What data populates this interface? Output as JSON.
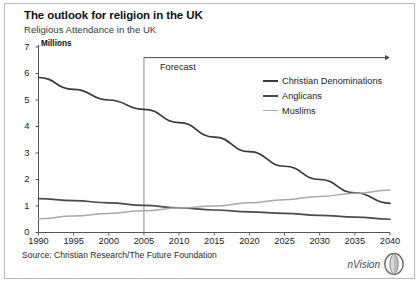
{
  "header": {
    "title": "The outlook for religion in the UK",
    "subtitle": "Religious Attendance in the UK",
    "units": "Millions"
  },
  "footer": {
    "source": "Source: Christian Research/The Future Foundation",
    "logo_text": "nVision",
    "logo_icon": "lens-circle-icon"
  },
  "annotations": {
    "forecast_label": "Forecast",
    "forecast_start_year": 2005
  },
  "colors": {
    "christian": "#3a3a3a",
    "anglicans": "#4a4a4a",
    "muslims": "#a8a8a8",
    "axis": "#555555",
    "border": "#b9b9b9",
    "background": "#ffffff"
  },
  "chart_data": {
    "type": "line",
    "title": "The outlook for religion in the UK",
    "subtitle": "Religious Attendance in the UK",
    "xlabel": "",
    "ylabel": "Millions",
    "xlim": [
      1990,
      2040
    ],
    "ylim": [
      0,
      7
    ],
    "yticks": [
      0,
      1,
      2,
      3,
      4,
      5,
      6,
      7
    ],
    "xticks": [
      1990,
      1995,
      2000,
      2005,
      2010,
      2015,
      2020,
      2025,
      2030,
      2035,
      2040
    ],
    "grid": false,
    "legend_position": "upper-right",
    "x": [
      1990,
      1995,
      2000,
      2005,
      2010,
      2015,
      2020,
      2025,
      2030,
      2035,
      2040
    ],
    "series": [
      {
        "name": "Christian Denominations",
        "color": "#3a3a3a",
        "values": [
          5.85,
          5.4,
          5.0,
          4.65,
          4.15,
          3.6,
          3.05,
          2.5,
          2.0,
          1.5,
          1.1
        ]
      },
      {
        "name": "Anglicans",
        "color": "#4a4a4a",
        "values": [
          1.28,
          1.2,
          1.12,
          1.02,
          0.93,
          0.85,
          0.78,
          0.72,
          0.65,
          0.58,
          0.5
        ]
      },
      {
        "name": "Muslims",
        "color": "#a8a8a8",
        "values": [
          0.52,
          0.62,
          0.72,
          0.82,
          0.92,
          1.0,
          1.12,
          1.24,
          1.36,
          1.48,
          1.6
        ]
      }
    ],
    "annotations": [
      {
        "type": "vline",
        "x": 2005,
        "label": "Forecast"
      },
      {
        "type": "arrow",
        "from_x": 2005,
        "to_x": 2040,
        "y": 6.6,
        "direction": "right"
      }
    ]
  }
}
